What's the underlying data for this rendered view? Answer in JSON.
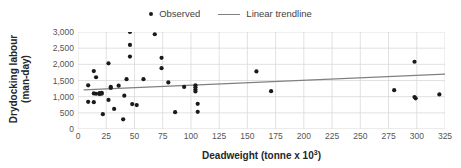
{
  "chart_data": {
    "type": "scatter",
    "title": "",
    "xlabel": "Deadweight (tonne x 10³)",
    "ylabel": "Drydocking labour (man-day)",
    "ylabel_line1": "Drydocking labour",
    "ylabel_line2": "(man-day)",
    "xlim": [
      0,
      325
    ],
    "ylim": [
      0,
      3000
    ],
    "xticks": [
      0,
      25,
      50,
      75,
      100,
      125,
      150,
      175,
      200,
      225,
      250,
      275,
      300,
      325
    ],
    "xtick_labels": [
      "0",
      "25",
      "50",
      "75",
      "100",
      "125",
      "150",
      "175",
      "200",
      "225",
      "250",
      "275",
      "300",
      "325"
    ],
    "yticks": [
      0,
      500,
      1000,
      1500,
      2000,
      2500,
      3000
    ],
    "ytick_labels": [
      "0",
      "500",
      "1,000",
      "1,500",
      "2,000",
      "2,500",
      "3,000"
    ],
    "grid": true,
    "grid_color": "#d9d9d9",
    "legend_position": "top-center",
    "legend": [
      {
        "label": "Observed",
        "marker": "dot",
        "color": "#1a1a1a"
      },
      {
        "label": "Linear trendline",
        "marker": "line",
        "color": "#808080"
      }
    ],
    "series": [
      {
        "name": "Observed",
        "marker": "dot",
        "color": "#1a1a1a",
        "points": [
          [
            9,
            1350
          ],
          [
            9,
            840
          ],
          [
            14,
            1790
          ],
          [
            14,
            1100
          ],
          [
            14,
            830
          ],
          [
            16,
            1600
          ],
          [
            16,
            1090
          ],
          [
            19,
            1080
          ],
          [
            19,
            1110
          ],
          [
            21,
            1090
          ],
          [
            21,
            1120
          ],
          [
            22,
            460
          ],
          [
            27,
            2030
          ],
          [
            27,
            900
          ],
          [
            29,
            1300
          ],
          [
            29,
            1270
          ],
          [
            32,
            620
          ],
          [
            36,
            1340
          ],
          [
            40,
            300
          ],
          [
            41,
            1030
          ],
          [
            43,
            1540
          ],
          [
            46,
            2240
          ],
          [
            46,
            2600
          ],
          [
            46,
            3000
          ],
          [
            48,
            770
          ],
          [
            52,
            740
          ],
          [
            58,
            1540
          ],
          [
            68,
            2930
          ],
          [
            74,
            2200
          ],
          [
            74,
            1880
          ],
          [
            80,
            1440
          ],
          [
            86,
            520
          ],
          [
            94,
            1300
          ],
          [
            104,
            1350
          ],
          [
            104,
            1290
          ],
          [
            104,
            1220
          ],
          [
            104,
            1160
          ],
          [
            106,
            780
          ],
          [
            106,
            530
          ],
          [
            158,
            1780
          ],
          [
            171,
            1170
          ],
          [
            280,
            1200
          ],
          [
            298,
            2080
          ],
          [
            298,
            990
          ],
          [
            299,
            950
          ],
          [
            320,
            1070
          ]
        ]
      }
    ],
    "trendline": {
      "name": "Linear trendline",
      "color": "#808080",
      "x_start": 5,
      "y_start": 1210,
      "x_end": 325,
      "y_end": 1700
    }
  }
}
